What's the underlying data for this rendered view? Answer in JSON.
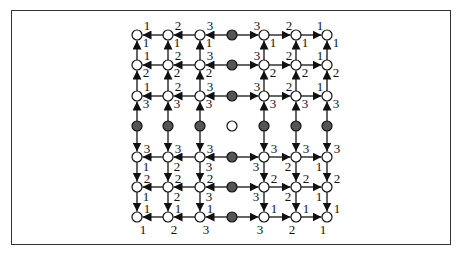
{
  "figure": {
    "colors": {
      "white_node_fill": "#ffffff",
      "gray_node_fill": "#555555",
      "stroke": "#111111",
      "frame": "#333333"
    },
    "grid": {
      "cols_x": [
        137,
        168,
        200,
        232,
        264,
        296,
        327
      ],
      "rows_y": [
        35,
        65,
        96,
        126,
        157,
        187,
        217
      ],
      "center_index": 3,
      "node_radius": 5
    },
    "labels": {
      "col_distance": [
        1,
        2,
        3,
        null,
        3,
        2,
        1
      ],
      "row_distance": [
        1,
        2,
        3,
        null,
        3,
        2,
        1
      ]
    }
  }
}
